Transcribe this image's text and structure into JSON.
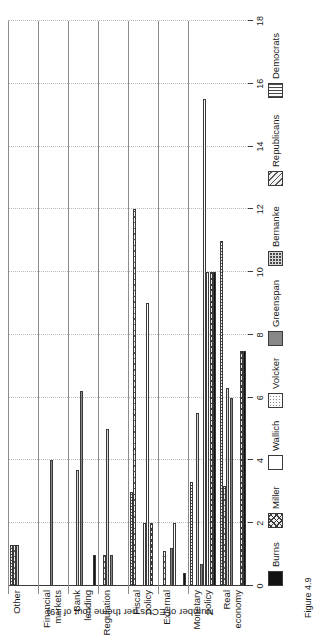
{
  "figure": {
    "caption": "Figure 4.9"
  },
  "chart_data": {
    "type": "bar",
    "orientation": "grouped-horizontal-rotated",
    "title": "",
    "xlabel": "",
    "ylabel": "Number of ECUs per theme (out of 19)",
    "ylim": [
      0,
      18
    ],
    "yticks": [
      "0",
      "2",
      "4",
      "6",
      "8",
      "10",
      "12",
      "14",
      "16",
      "18"
    ],
    "grid": true,
    "legend_position": "bottom",
    "categories": [
      "Real\neconomy",
      "Monetary\npolicy",
      "External",
      "Fiscal\npolicy",
      "Regulation",
      "Bank\nlending",
      "Financial\nmarkets",
      "Other"
    ],
    "series": [
      {
        "name": "Burns",
        "pattern": "solid-black",
        "values": [
          7.5,
          10.0,
          0.4,
          0.0,
          0.0,
          1.0,
          0.0,
          0.0
        ]
      },
      {
        "name": "Miller",
        "pattern": "crosshatch",
        "values": [
          7.5,
          10.0,
          0.0,
          2.0,
          0.0,
          0.0,
          0.0,
          0.0
        ]
      },
      {
        "name": "Wallich",
        "pattern": "white",
        "values": [
          0.0,
          10.0,
          0.0,
          9.0,
          0.0,
          0.0,
          0.0,
          0.0
        ]
      },
      {
        "name": "Volcker",
        "pattern": "dotted",
        "values": [
          0.0,
          15.5,
          2.0,
          2.0,
          0.0,
          0.0,
          0.0,
          0.0
        ]
      },
      {
        "name": "Greenspan",
        "pattern": "solid-grey",
        "values": [
          6.0,
          0.7,
          1.2,
          0.0,
          1.0,
          6.2,
          4.0,
          0.0
        ]
      },
      {
        "name": "Bernanke",
        "pattern": "checkerboard",
        "values": [
          6.3,
          5.5,
          0.0,
          0.0,
          5.0,
          3.7,
          0.0,
          1.3
        ]
      },
      {
        "name": "Republicans",
        "pattern": "diagonal-hatch",
        "values": [
          3.2,
          0.0,
          1.1,
          12.0,
          1.0,
          0.0,
          0.0,
          1.3
        ]
      },
      {
        "name": "Democrats",
        "pattern": "vertical-lines",
        "values": [
          11.0,
          3.3,
          0.0,
          3.0,
          0.0,
          0.0,
          0.0,
          1.3
        ]
      }
    ]
  }
}
